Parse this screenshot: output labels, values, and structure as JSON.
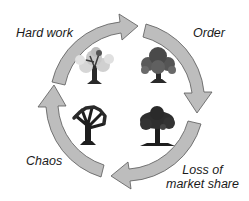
{
  "diagram": {
    "title": "",
    "type": "cycle",
    "direction": "clockwise",
    "colors": {
      "arrow_fill": "#bdbdbd",
      "arrow_stroke": "#595959",
      "text": "#1a1a1a",
      "background": "#ffffff"
    },
    "stages": [
      {
        "id": "hard-work",
        "label": "Hard work",
        "position": "top-left",
        "tree": "light-leafy-tree"
      },
      {
        "id": "order",
        "label": "Order",
        "position": "top-right",
        "tree": "dense-dark-tree"
      },
      {
        "id": "loss",
        "label_line1": "Loss of",
        "label_line2": "market share",
        "position": "bottom-right",
        "tree": "dark-spreading-tree"
      },
      {
        "id": "chaos",
        "label": "Chaos",
        "position": "bottom-left",
        "tree": "bare-dark-tree"
      }
    ],
    "arrows": [
      {
        "from": "hard-work",
        "to": "order"
      },
      {
        "from": "order",
        "to": "loss"
      },
      {
        "from": "loss",
        "to": "chaos"
      },
      {
        "from": "chaos",
        "to": "hard-work"
      }
    ]
  }
}
